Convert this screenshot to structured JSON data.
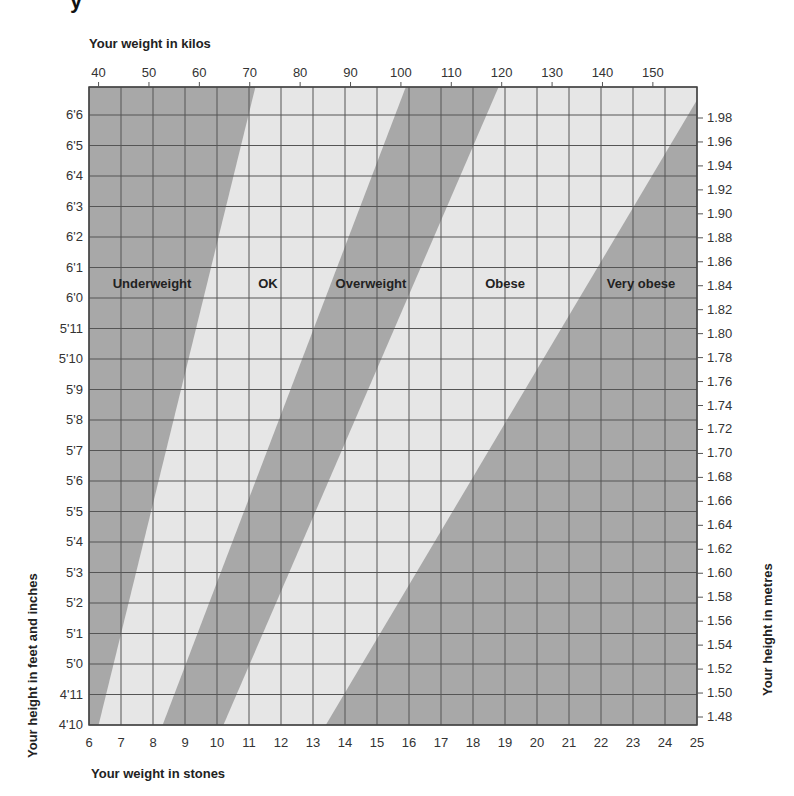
{
  "chart_data": {
    "type": "heatmap",
    "top_axis": {
      "label": "Your weight in kilos",
      "ticks": [
        40,
        50,
        60,
        70,
        80,
        90,
        100,
        110,
        120,
        130,
        140,
        150
      ]
    },
    "bottom_axis": {
      "label": "Your weight in stones",
      "ticks": [
        6,
        7,
        8,
        9,
        10,
        11,
        12,
        13,
        14,
        15,
        16,
        17,
        18,
        19,
        20,
        21,
        22,
        23,
        24,
        25
      ],
      "range": [
        6,
        25
      ]
    },
    "left_axis": {
      "label": "Your height in feet and inches",
      "ticks": [
        "6'6",
        "6'5",
        "6'4",
        "6'3",
        "6'2",
        "6'1",
        "6'0",
        "5'11",
        "5'10",
        "5'9",
        "5'8",
        "5'7",
        "5'6",
        "5'5",
        "5'4",
        "5'3",
        "5'2",
        "5'1",
        "5'0",
        "4'11",
        "4'10"
      ]
    },
    "right_axis": {
      "label": "Your height in metres",
      "ticks": [
        "1.98",
        "1.96",
        "1.94",
        "1.92",
        "1.90",
        "1.88",
        "1.86",
        "1.84",
        "1.82",
        "1.80",
        "1.78",
        "1.76",
        "1.74",
        "1.72",
        "1.70",
        "1.68",
        "1.66",
        "1.64",
        "1.62",
        "1.60",
        "1.58",
        "1.56",
        "1.54",
        "1.52",
        "1.50",
        "1.48"
      ]
    },
    "zones": [
      {
        "name": "Underweight",
        "shade": "dark",
        "color": "#a8a8a8"
      },
      {
        "name": "OK",
        "shade": "light",
        "color": "#e6e6e6"
      },
      {
        "name": "Overweight",
        "shade": "dark",
        "color": "#a8a8a8"
      },
      {
        "name": "Obese",
        "shade": "light",
        "color": "#e6e6e6"
      },
      {
        "name": "Very obese",
        "shade": "dark",
        "color": "#a8a8a8"
      }
    ],
    "boundaries_stones": [
      {
        "between": "Underweight/OK",
        "at_4ft10": 6.3,
        "at_top": 11.2
      },
      {
        "between": "OK/Overweight",
        "at_4ft10": 8.3,
        "at_top": 15.9
      },
      {
        "between": "Overweight/Obese",
        "at_4ft10": 10.2,
        "at_top": 18.8
      },
      {
        "between": "Obese/Very obese",
        "at_4ft10": 13.4,
        "at_top": 25
      }
    ],
    "grid": true
  },
  "title_fragment": "y"
}
